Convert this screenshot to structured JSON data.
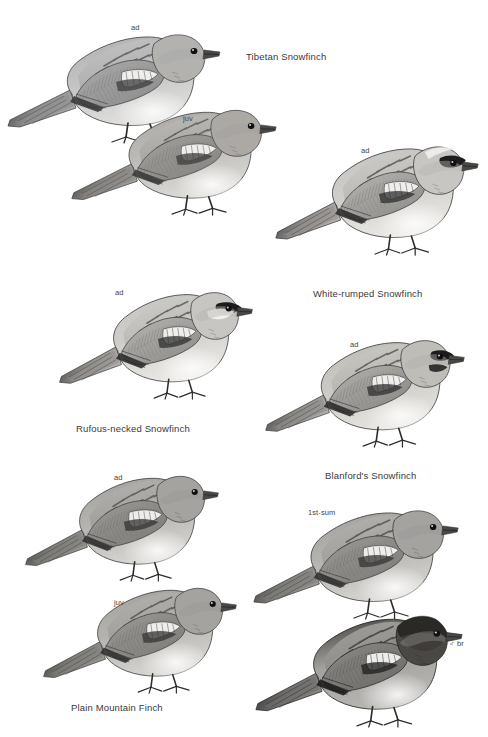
{
  "plate": {
    "width": 488,
    "height": 737,
    "background": "#ffffff",
    "ink": "#3a3a3a",
    "type": "field-guide-illustration-plate",
    "subject": "snowfinches and mountain finch"
  },
  "species": [
    {
      "id": "tibetan-snowfinch",
      "name": "Tibetan Snowfinch",
      "label_x": 246,
      "label_y": 51,
      "figures": [
        {
          "id": "tibetan-ad",
          "age": "ad",
          "label_x": 131,
          "label_y": 23,
          "x": 4,
          "y": 16,
          "w": 220,
          "h": 130,
          "tone": "pale-grey",
          "head": "plain",
          "flip": false
        },
        {
          "id": "tibetan-juv",
          "age": "juv",
          "label_x": 183,
          "label_y": 114,
          "x": 68,
          "y": 92,
          "w": 212,
          "h": 126,
          "tone": "warm-grey",
          "head": "plain",
          "flip": false
        }
      ]
    },
    {
      "id": "white-rumped-snowfinch",
      "name": "White-rumped Snowfinch",
      "label_x": 313,
      "label_y": 288,
      "figures": [
        {
          "id": "white-rumped-ad",
          "age": "ad",
          "label_x": 361,
          "label_y": 146,
          "x": 272,
          "y": 128,
          "w": 210,
          "h": 130,
          "tone": "pale",
          "head": "black-mask",
          "flip": false
        }
      ]
    },
    {
      "id": "rufous-necked-snowfinch",
      "name": "Rufous-necked Snowfinch",
      "label_x": 76,
      "label_y": 423,
      "figures": [
        {
          "id": "rufous-necked-ad",
          "age": "ad",
          "label_x": 115,
          "label_y": 288,
          "x": 56,
          "y": 274,
          "w": 200,
          "h": 128,
          "tone": "pale",
          "head": "black-cheek",
          "flip": false
        }
      ]
    },
    {
      "id": "blanfords-snowfinch",
      "name": "Blanford's Snowfinch",
      "label_x": 325,
      "label_y": 470,
      "figures": [
        {
          "id": "blanfords-ad",
          "age": "ad",
          "label_x": 350,
          "label_y": 340,
          "x": 262,
          "y": 322,
          "w": 206,
          "h": 128,
          "tone": "pale-buff",
          "head": "black-bib",
          "flip": false
        }
      ]
    },
    {
      "id": "plain-mountain-finch",
      "name": "Plain Mountain Finch",
      "label_x": 71,
      "label_y": 702,
      "figures": [
        {
          "id": "plain-mf-ad",
          "age": "ad",
          "label_x": 114,
          "label_y": 473,
          "x": 22,
          "y": 458,
          "w": 200,
          "h": 126,
          "tone": "mid-grey",
          "head": "plain",
          "flip": false
        },
        {
          "id": "plain-mf-juv",
          "age": "juv",
          "label_x": 114,
          "label_y": 598,
          "x": 40,
          "y": 570,
          "w": 200,
          "h": 126,
          "tone": "mid-grey",
          "head": "plain",
          "flip": false
        },
        {
          "id": "plain-mf-1st-sum",
          "age": "1st-sum",
          "label_x": 308,
          "label_y": 508,
          "x": 250,
          "y": 492,
          "w": 212,
          "h": 130,
          "tone": "mid-grey",
          "head": "plain",
          "flip": false
        },
        {
          "id": "plain-mf-male-br",
          "age": "♂ br",
          "label_x": 449,
          "label_y": 639,
          "x": 252,
          "y": 598,
          "w": 214,
          "h": 132,
          "tone": "dark-grey",
          "head": "dark-hood",
          "flip": false
        }
      ]
    }
  ]
}
